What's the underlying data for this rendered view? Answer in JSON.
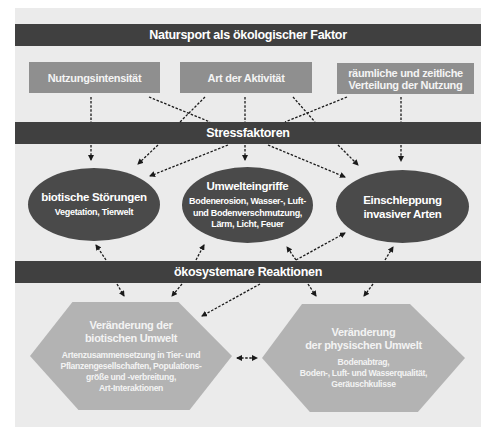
{
  "title": "Natursport als ökologischer Faktor",
  "factors": [
    {
      "label": "Nutzungsintensität"
    },
    {
      "label": "Art der Aktivität"
    },
    {
      "label": "räumliche und zeitliche Verteilung der Nutzung",
      "line1": "räumliche und zeitliche",
      "line2": "Verteilung der Nutzung"
    }
  ],
  "stress_bar": {
    "label": "Stressfaktoren"
  },
  "stressors": [
    {
      "title": "biotische Störungen",
      "subtitle_lines": [
        "Vegetation, Tierwelt"
      ]
    },
    {
      "title": "Umwelteingriffe",
      "subtitle_lines": [
        "Bodenerosion, Wasser-, Luft-",
        "und Bodenverschmutzung,",
        "Lärm, Licht, Feuer"
      ]
    },
    {
      "title_lines": [
        "Einschleppung",
        "invasiver Arten"
      ]
    }
  ],
  "reaction_bar": {
    "label": "ökosystemare Reaktionen"
  },
  "reactions": [
    {
      "title_lines": [
        "Veränderung der",
        "biotischen Umwelt"
      ],
      "subtitle_lines": [
        "Artenzusammensetzung in Tier- und",
        "Pflanzengesellschaften, Populations-",
        "größe und -verbreitung,",
        "Art-Interaktionen"
      ]
    },
    {
      "title_lines": [
        "Veränderung",
        "der physischen Umwelt"
      ],
      "subtitle_lines": [
        "Bodenabtrag,",
        "Boden-, Luft- und Wasserqualität,",
        "Geräuschkulisse"
      ]
    }
  ],
  "colors": {
    "panel": "#ebebeb",
    "banner": "#404040",
    "factor_box": "#8f8f8f",
    "ellipse": "#4a4a4a",
    "hexagon": "#b3b3b3",
    "arrow": "#1a1a1a"
  }
}
